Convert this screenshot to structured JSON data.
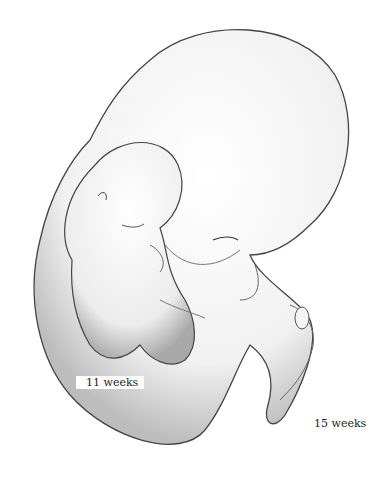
{
  "figure": {
    "labels": {
      "small_fetus": "11 weeks",
      "large_fetus": "15 weeks"
    },
    "colors": {
      "background": "#ffffff",
      "outline": "#333333",
      "shading": "#9a9a9a"
    }
  }
}
